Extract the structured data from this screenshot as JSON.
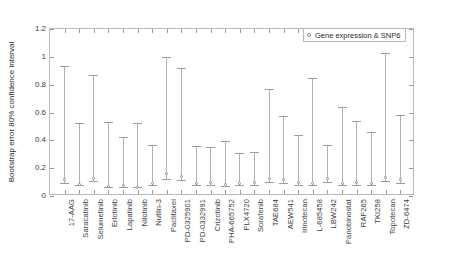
{
  "chart_data": {
    "type": "bar",
    "title": "",
    "subtitle": "",
    "xlabel": "",
    "ylabel": "Bootstrap error 80% confidence interval",
    "ylim": [
      0,
      1.2
    ],
    "yticks": [
      0,
      0.2,
      0.4,
      0.6,
      0.8,
      1,
      1.2
    ],
    "ytick_labels": [
      "0",
      "0.2",
      "0.4",
      "0.6",
      "0.8",
      "1",
      "1.2"
    ],
    "grid": false,
    "legend_position": "top-right",
    "legend": [
      "Gene expression & SNP6"
    ],
    "series_name": "Gene expression & SNP6",
    "marker_style": "open-circle",
    "categories": [
      "17-AAG",
      "Saracatinib",
      "Selumetinib",
      "Erlotinib",
      "Lapatinib",
      "Nilotinib",
      "Nutlin-3",
      "Paclitaxel",
      "PD-0325901",
      "PD-0332991",
      "Crizotinib",
      "PHA-665752",
      "PLX4720",
      "Sorafenib",
      "TAE684",
      "AEW541",
      "Irinotecan",
      "L-685458",
      "LBW242",
      "Panobinostat",
      "RAF265",
      "TKI258",
      "Topotecan",
      "ZD-6474"
    ],
    "lower": [
      0.07,
      0.055,
      0.085,
      0.04,
      0.045,
      0.04,
      0.055,
      0.1,
      0.09,
      0.055,
      0.06,
      0.05,
      0.055,
      0.06,
      0.08,
      0.075,
      0.06,
      0.055,
      0.08,
      0.055,
      0.06,
      0.055,
      0.085,
      0.075
    ],
    "values": [
      0.105,
      0.065,
      0.115,
      0.055,
      0.062,
      0.05,
      0.075,
      0.145,
      0.125,
      0.075,
      0.08,
      0.068,
      0.072,
      0.082,
      0.115,
      0.105,
      0.08,
      0.075,
      0.11,
      0.075,
      0.085,
      0.078,
      0.12,
      0.105
    ],
    "upper": [
      0.915,
      0.505,
      0.845,
      0.51,
      0.405,
      0.5,
      0.345,
      0.975,
      0.895,
      0.335,
      0.33,
      0.375,
      0.285,
      0.295,
      0.745,
      0.555,
      0.42,
      0.825,
      0.345,
      0.615,
      0.52,
      0.435,
      1.005,
      0.56
    ]
  },
  "legend": {
    "entry_label": "Gene expression & SNP6",
    "marker_name": "open-circle-marker"
  },
  "axes": {
    "y_title": "Bootstrap error 80% confidence interval"
  }
}
